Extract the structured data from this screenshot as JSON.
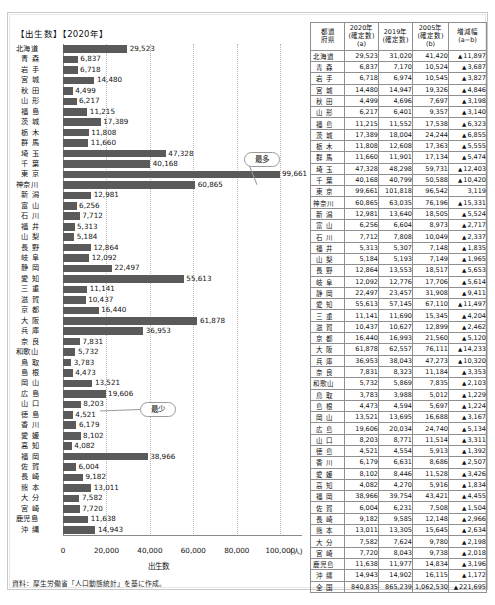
{
  "chart_data": {
    "type": "bar",
    "title": "【出生数】【2020年】",
    "xlabel": "出生数",
    "ylabel": "",
    "unit": "(人)",
    "xlim": [
      0,
      110000
    ],
    "xticks": [
      0,
      20000,
      40000,
      60000,
      80000,
      100000
    ],
    "xticklabels": [
      "0",
      "20,000",
      "40,000",
      "60,000",
      "80,000",
      "100,000"
    ],
    "grid": true,
    "orientation": "horizontal",
    "bar_color": "#5a5a5a",
    "categories": [
      "北海道",
      "青森",
      "岩手",
      "宮城",
      "秋田",
      "山形",
      "福島",
      "茨城",
      "栃木",
      "群馬",
      "埼玉",
      "千葉",
      "東京",
      "神奈川",
      "新潟",
      "富山",
      "石川",
      "福井",
      "山梨",
      "長野",
      "岐阜",
      "静岡",
      "愛知",
      "三重",
      "滋賀",
      "京都",
      "大阪",
      "兵庫",
      "奈良",
      "和歌山",
      "鳥取",
      "島根",
      "岡山",
      "広島",
      "山口",
      "徳島",
      "香川",
      "愛媛",
      "高知",
      "福岡",
      "佐賀",
      "長崎",
      "熊本",
      "大分",
      "宮崎",
      "鹿児島",
      "沖縄"
    ],
    "values": [
      29523,
      6837,
      6718,
      14480,
      4499,
      6217,
      11215,
      17389,
      11808,
      11660,
      47328,
      40168,
      99661,
      60865,
      12981,
      6256,
      7712,
      5313,
      5184,
      12864,
      12092,
      22497,
      55613,
      11141,
      10437,
      16440,
      61878,
      36953,
      7831,
      5732,
      3783,
      4473,
      13521,
      19606,
      8203,
      4521,
      6179,
      8102,
      4082,
      38966,
      6004,
      9182,
      13011,
      7582,
      7720,
      11638,
      14943
    ],
    "value_labels": [
      "29,523",
      "6,837",
      "6,718",
      "14,480",
      "4,499",
      "6,217",
      "11,215",
      "17,389",
      "11,808",
      "11,660",
      "47,328",
      "40,168",
      "99,661",
      "60,865",
      "12,981",
      "6,256",
      "7,712",
      "5,313",
      "5,184",
      "12,864",
      "12,092",
      "22,497",
      "55,613",
      "11,141",
      "10,437",
      "16,440",
      "61,878",
      "36,953",
      "7,831",
      "5,732",
      "3,783",
      "4,473",
      "13,521",
      "19,606",
      "8,203",
      "4,521",
      "6,179",
      "8,102",
      "4,082",
      "38,966",
      "6,004",
      "9,182",
      "13,011",
      "7,582",
      "7,720",
      "11,638",
      "14,943"
    ],
    "annotations": [
      {
        "text": "最多",
        "target_category": "東京",
        "target_value": 99661
      },
      {
        "text": "最少",
        "target_category": "鳥取",
        "target_value": 3783
      }
    ]
  },
  "table": {
    "headers": [
      {
        "l1": "都道",
        "l2": "府県",
        "l3": ""
      },
      {
        "l1": "2020年",
        "l2": "(確定数)",
        "l3": "(a)"
      },
      {
        "l1": "2019年",
        "l2": "(確定数)",
        "l3": ""
      },
      {
        "l1": "2005年",
        "l2": "(確定数)",
        "l3": "(b)"
      },
      {
        "l1": "増減幅",
        "l2": "(a−b)",
        "l3": ""
      }
    ],
    "rows": [
      {
        "name": "北海道",
        "y2020": "29,523",
        "y2019": "31,020",
        "y2005": "41,420",
        "diff": "11,897",
        "neg": true
      },
      {
        "name": "青森",
        "y2020": "6,837",
        "y2019": "7,170",
        "y2005": "10,524",
        "diff": "3,687",
        "neg": true
      },
      {
        "name": "岩手",
        "y2020": "6,718",
        "y2019": "6,974",
        "y2005": "10,545",
        "diff": "3,827",
        "neg": true
      },
      {
        "name": "宮城",
        "y2020": "14,480",
        "y2019": "14,947",
        "y2005": "19,326",
        "diff": "4,846",
        "neg": true
      },
      {
        "name": "秋田",
        "y2020": "4,499",
        "y2019": "4,696",
        "y2005": "7,697",
        "diff": "3,198",
        "neg": true
      },
      {
        "name": "山形",
        "y2020": "6,217",
        "y2019": "6,401",
        "y2005": "9,357",
        "diff": "3,140",
        "neg": true
      },
      {
        "name": "福島",
        "y2020": "11,215",
        "y2019": "11,552",
        "y2005": "17,538",
        "diff": "6,323",
        "neg": true
      },
      {
        "name": "茨城",
        "y2020": "17,389",
        "y2019": "18,004",
        "y2005": "24,244",
        "diff": "6,855",
        "neg": true
      },
      {
        "name": "栃木",
        "y2020": "11,808",
        "y2019": "12,608",
        "y2005": "17,363",
        "diff": "5,555",
        "neg": true
      },
      {
        "name": "群馬",
        "y2020": "11,660",
        "y2019": "11,901",
        "y2005": "17,134",
        "diff": "5,474",
        "neg": true
      },
      {
        "name": "埼玉",
        "y2020": "47,328",
        "y2019": "48,298",
        "y2005": "59,731",
        "diff": "12,403",
        "neg": true
      },
      {
        "name": "千葉",
        "y2020": "40,168",
        "y2019": "40,799",
        "y2005": "50,588",
        "diff": "10,420",
        "neg": true
      },
      {
        "name": "東京",
        "y2020": "99,661",
        "y2019": "101,818",
        "y2005": "96,542",
        "diff": "3,119",
        "neg": false
      },
      {
        "name": "神奈川",
        "y2020": "60,865",
        "y2019": "63,035",
        "y2005": "76,196",
        "diff": "15,331",
        "neg": true
      },
      {
        "name": "新潟",
        "y2020": "12,981",
        "y2019": "13,640",
        "y2005": "18,505",
        "diff": "5,524",
        "neg": true
      },
      {
        "name": "富山",
        "y2020": "6,256",
        "y2019": "6,604",
        "y2005": "8,973",
        "diff": "2,717",
        "neg": true
      },
      {
        "name": "石川",
        "y2020": "7,712",
        "y2019": "7,808",
        "y2005": "10,049",
        "diff": "2,337",
        "neg": true
      },
      {
        "name": "福井",
        "y2020": "5,313",
        "y2019": "5,307",
        "y2005": "7,148",
        "diff": "1,835",
        "neg": true
      },
      {
        "name": "山梨",
        "y2020": "5,184",
        "y2019": "5,193",
        "y2005": "7,149",
        "diff": "1,965",
        "neg": true
      },
      {
        "name": "長野",
        "y2020": "12,864",
        "y2019": "13,553",
        "y2005": "18,517",
        "diff": "5,653",
        "neg": true
      },
      {
        "name": "岐阜",
        "y2020": "12,092",
        "y2019": "12,776",
        "y2005": "17,706",
        "diff": "5,614",
        "neg": true
      },
      {
        "name": "静岡",
        "y2020": "22,497",
        "y2019": "23,457",
        "y2005": "31,908",
        "diff": "9,411",
        "neg": true
      },
      {
        "name": "愛知",
        "y2020": "55,613",
        "y2019": "57,145",
        "y2005": "67,110",
        "diff": "11,497",
        "neg": true
      },
      {
        "name": "三重",
        "y2020": "11,141",
        "y2019": "11,690",
        "y2005": "15,345",
        "diff": "4,204",
        "neg": true
      },
      {
        "name": "滋賀",
        "y2020": "10,437",
        "y2019": "10,627",
        "y2005": "12,899",
        "diff": "2,462",
        "neg": true
      },
      {
        "name": "京都",
        "y2020": "16,440",
        "y2019": "16,993",
        "y2005": "21,560",
        "diff": "5,120",
        "neg": true
      },
      {
        "name": "大阪",
        "y2020": "61,878",
        "y2019": "62,557",
        "y2005": "76,111",
        "diff": "14,233",
        "neg": true
      },
      {
        "name": "兵庫",
        "y2020": "36,953",
        "y2019": "38,043",
        "y2005": "47,273",
        "diff": "10,320",
        "neg": true
      },
      {
        "name": "奈良",
        "y2020": "7,831",
        "y2019": "8,323",
        "y2005": "11,184",
        "diff": "3,353",
        "neg": true
      },
      {
        "name": "和歌山",
        "y2020": "5,732",
        "y2019": "5,869",
        "y2005": "7,835",
        "diff": "2,103",
        "neg": true
      },
      {
        "name": "鳥取",
        "y2020": "3,783",
        "y2019": "3,988",
        "y2005": "5,012",
        "diff": "1,229",
        "neg": true
      },
      {
        "name": "島根",
        "y2020": "4,473",
        "y2019": "4,594",
        "y2005": "5,697",
        "diff": "1,224",
        "neg": true
      },
      {
        "name": "岡山",
        "y2020": "13,521",
        "y2019": "13,695",
        "y2005": "16,688",
        "diff": "3,167",
        "neg": true
      },
      {
        "name": "広島",
        "y2020": "19,606",
        "y2019": "20,034",
        "y2005": "24,740",
        "diff": "5,134",
        "neg": true
      },
      {
        "name": "山口",
        "y2020": "8,203",
        "y2019": "8,771",
        "y2005": "11,514",
        "diff": "3,311",
        "neg": true
      },
      {
        "name": "徳島",
        "y2020": "4,521",
        "y2019": "4,554",
        "y2005": "5,913",
        "diff": "1,392",
        "neg": true
      },
      {
        "name": "香川",
        "y2020": "6,179",
        "y2019": "6,631",
        "y2005": "8,686",
        "diff": "2,507",
        "neg": true
      },
      {
        "name": "愛媛",
        "y2020": "8,102",
        "y2019": "8,446",
        "y2005": "11,528",
        "diff": "3,426",
        "neg": true
      },
      {
        "name": "高知",
        "y2020": "4,082",
        "y2019": "4,270",
        "y2005": "5,916",
        "diff": "1,834",
        "neg": true
      },
      {
        "name": "福岡",
        "y2020": "38,966",
        "y2019": "39,754",
        "y2005": "43,421",
        "diff": "4,455",
        "neg": true
      },
      {
        "name": "佐賀",
        "y2020": "6,004",
        "y2019": "6,231",
        "y2005": "7,508",
        "diff": "1,504",
        "neg": true
      },
      {
        "name": "長崎",
        "y2020": "9,182",
        "y2019": "9,585",
        "y2005": "12,148",
        "diff": "2,966",
        "neg": true
      },
      {
        "name": "熊本",
        "y2020": "13,011",
        "y2019": "13,305",
        "y2005": "15,645",
        "diff": "2,634",
        "neg": true
      },
      {
        "name": "大分",
        "y2020": "7,582",
        "y2019": "7,624",
        "y2005": "9,780",
        "diff": "2,198",
        "neg": true
      },
      {
        "name": "宮崎",
        "y2020": "7,720",
        "y2019": "8,043",
        "y2005": "9,738",
        "diff": "2,018",
        "neg": true
      },
      {
        "name": "鹿児島",
        "y2020": "11,638",
        "y2019": "11,977",
        "y2005": "14,834",
        "diff": "3,196",
        "neg": true
      },
      {
        "name": "沖縄",
        "y2020": "14,943",
        "y2019": "14,902",
        "y2005": "16,115",
        "diff": "1,172",
        "neg": true
      },
      {
        "name": "全国",
        "y2020": "840,835",
        "y2019": "865,239",
        "y2005": "1,062,530",
        "diff": "221,695",
        "neg": true
      }
    ]
  },
  "footer": {
    "source": "資料：厚生労働省「人口動態統計」を基に作成。"
  }
}
